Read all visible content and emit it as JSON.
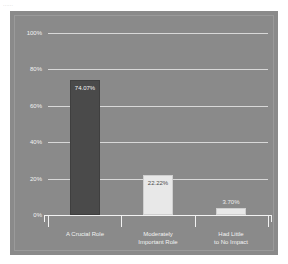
{
  "top_strip_text": "......",
  "chart_data": {
    "type": "bar",
    "title": "",
    "xlabel": "",
    "ylabel": "",
    "categories": [
      "A Crucial Role",
      "Moderately Important Role",
      "Had Little to No Impact"
    ],
    "category_lines": [
      [
        "A Crucial Role"
      ],
      [
        "Moderately",
        "Important Role"
      ],
      [
        "Had Little",
        "to No Impact"
      ]
    ],
    "values": [
      74.07,
      22.22,
      3.7
    ],
    "value_labels": [
      "74.07%",
      "22.22%",
      "3.70%"
    ],
    "bar_colors": [
      "#4a4a4a",
      "#e8e8e8",
      "#e8e8e8"
    ],
    "ylim": [
      0,
      100
    ],
    "ytick_values": [
      100,
      80,
      60,
      40,
      20,
      0
    ],
    "ytick_labels": [
      "100%",
      "80%",
      "60%",
      "40%",
      "20%",
      "0%"
    ],
    "grid": true,
    "legend": "none",
    "background_color": "#8a8a8a",
    "gridline_color": "#d8d8d8",
    "axis_color": "#f2f2f2",
    "text_color": "#f2f2f2"
  }
}
